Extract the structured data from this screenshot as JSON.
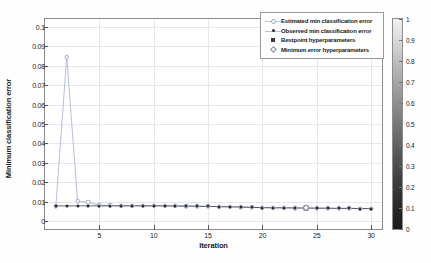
{
  "chart_data": {
    "type": "line",
    "title": "",
    "xlabel": "Iteration",
    "ylabel": "Minimum classification error",
    "xlim": [
      0,
      31
    ],
    "ylim": [
      -0.004,
      0.104
    ],
    "grid": true,
    "legend_position": "top-right",
    "x_ticks": [
      5,
      10,
      15,
      20,
      25,
      30
    ],
    "y_ticks": [
      0,
      0.01,
      0.02,
      0.03,
      0.04,
      0.05,
      0.06,
      0.07,
      0.08,
      0.09,
      0.1
    ],
    "y_tick_labels": [
      "0",
      "0.01",
      "0.02",
      "0.03",
      "0.04",
      "0.05",
      "0.06",
      "0.07",
      "0.08",
      "0.09",
      "0.1"
    ],
    "x": [
      1,
      2,
      3,
      4,
      5,
      6,
      7,
      8,
      9,
      10,
      11,
      12,
      13,
      14,
      15,
      16,
      17,
      18,
      19,
      20,
      21,
      22,
      23,
      24,
      25,
      26,
      27,
      28,
      29,
      30
    ],
    "series": [
      {
        "name": "Estimated min classification error",
        "marker": "open-circle",
        "color": "#9aa4c8",
        "values": [
          0.0078,
          0.0845,
          0.0102,
          0.0098,
          0.0081,
          0.0081,
          0.008,
          0.008,
          0.008,
          0.008,
          0.0079,
          0.0079,
          0.0078,
          0.0077,
          0.0076,
          0.0075,
          0.0074,
          0.0073,
          0.0071,
          0.007,
          0.0069,
          0.0069,
          0.0068,
          0.0068,
          0.0067,
          0.0067,
          0.0066,
          0.0066,
          0.0065,
          0.0065
        ]
      },
      {
        "name": "Observed min classification error",
        "marker": "filled-circle",
        "color": "#2a2a2a",
        "values": [
          0.0079,
          0.0079,
          0.0079,
          0.0079,
          0.0079,
          0.0079,
          0.0079,
          0.0079,
          0.0079,
          0.0079,
          0.0079,
          0.0078,
          0.0078,
          0.0077,
          0.0076,
          0.0075,
          0.0074,
          0.0073,
          0.0071,
          0.007,
          0.0069,
          0.0069,
          0.0068,
          0.0068,
          0.0067,
          0.0067,
          0.0066,
          0.0066,
          0.0065,
          0.0065
        ]
      }
    ],
    "bestpoint": {
      "name": "Bestpoint hyperparameters",
      "marker": "filled-square",
      "color": "#3a3a3a",
      "x": 24,
      "y": 0.0068
    },
    "minimum_error_point": {
      "name": "Minimum error hyperparameters",
      "marker": "open-diamond",
      "color": "#8a8a9c",
      "x": 24,
      "y": 0.0068
    },
    "colorbar": {
      "min": 0,
      "max": 1,
      "ticks": [
        0,
        0.1,
        0.2,
        0.3,
        0.4,
        0.5,
        0.6,
        0.7,
        0.8,
        0.9,
        1
      ],
      "tick_labels": [
        "0",
        "0.1",
        "0.2",
        "0.3",
        "0.4",
        "0.5",
        "0.6",
        "0.7",
        "0.8",
        "0.9",
        "1"
      ],
      "colormap": "grayscale"
    },
    "legend_entries": [
      "Estimated min classification error",
      "Observed min classification error",
      "Bestpoint hyperparameters",
      "Minimum error hyperparameters"
    ]
  }
}
